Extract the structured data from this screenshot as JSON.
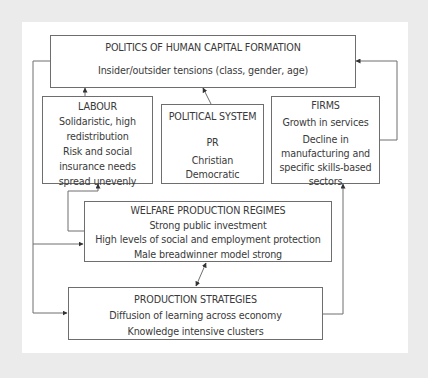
{
  "diagram": {
    "boxes": {
      "politics": {
        "title": "POLITICS OF HUMAN CAPITAL FORMATION",
        "lines": [
          "Insider/outsider tensions (class, gender, age)"
        ]
      },
      "labour": {
        "title": "LABOUR",
        "lines": [
          "Solidaristic, high",
          "redistribution",
          "Risk and social",
          "insurance needs",
          "spread unevenly"
        ]
      },
      "political_system": {
        "title": "POLITICAL SYSTEM",
        "lines": [
          "PR",
          "Christian",
          "Democratic"
        ]
      },
      "firms": {
        "title": "FIRMS",
        "lines": [
          "Growth in services",
          "Decline in",
          "manufacturing and",
          "specific skills-based",
          "sectors"
        ]
      },
      "welfare": {
        "title": "WELFARE PRODUCTION REGIMES",
        "lines": [
          "Strong public investment",
          "High levels of social and employment protection",
          "Male breadwinner model strong"
        ]
      },
      "production": {
        "title": "PRODUCTION STRATEGIES",
        "lines": [
          "Diffusion of learning across economy",
          "Knowledge intensive clusters"
        ]
      }
    },
    "edges": [
      {
        "from": "labour",
        "to": "politics"
      },
      {
        "from": "political_system",
        "to": "politics"
      },
      {
        "from": "firms",
        "to": "politics"
      },
      {
        "from": "politics",
        "to": "welfare"
      },
      {
        "from": "politics",
        "to": "production"
      },
      {
        "from": "welfare",
        "to": "labour"
      },
      {
        "from": "welfare",
        "to": "production",
        "bidirectional": true
      },
      {
        "from": "production",
        "to": "firms"
      }
    ],
    "colors": {
      "background": "#ebebeb",
      "panel": "#ffffff",
      "line": "#6e6e6e",
      "text": "#3a3a3a"
    }
  }
}
